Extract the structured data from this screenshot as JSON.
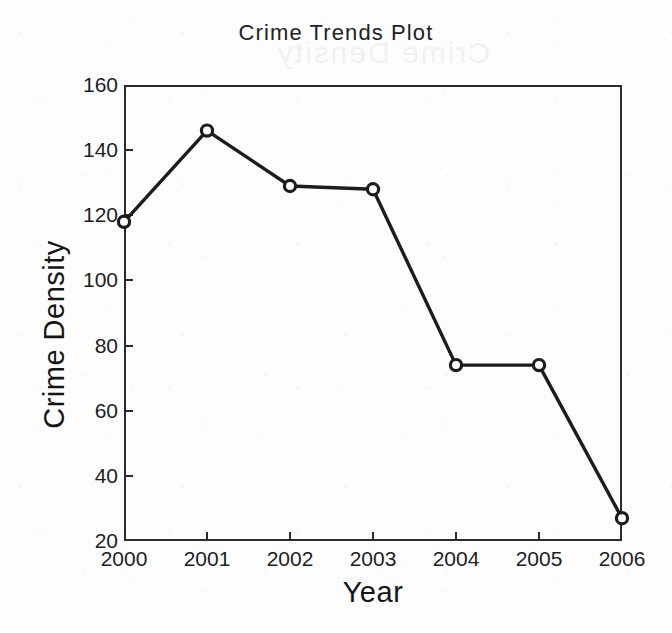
{
  "chart_data": {
    "type": "line",
    "title": "Crime Trends Plot",
    "xlabel": "Year",
    "ylabel": "Crime Density",
    "categories": [
      "2000",
      "2001",
      "2002",
      "2003",
      "2004",
      "2005",
      "2006"
    ],
    "x": [
      2000,
      2001,
      2002,
      2003,
      2004,
      2005,
      2006
    ],
    "values": [
      118,
      146,
      129,
      128,
      74,
      74,
      27
    ],
    "series": [
      {
        "name": "Crime Density",
        "values": [
          118,
          146,
          129,
          128,
          74,
          74,
          27
        ]
      }
    ],
    "xlim": [
      2000,
      2006
    ],
    "ylim": [
      20,
      160
    ],
    "ytick_labels": [
      "20",
      "40",
      "60",
      "80",
      "100",
      "120",
      "140",
      "160"
    ],
    "ytick_values": [
      20,
      40,
      60,
      80,
      100,
      120,
      140,
      160
    ],
    "xtick_labels": [
      "2000",
      "2001",
      "2002",
      "2003",
      "2004",
      "2005",
      "2006"
    ],
    "grid": false,
    "legend": null,
    "marker": "open-circle",
    "line_color": "#1c1c1c",
    "background_color": "#fdfdfd",
    "axis_color": "#2a2a2a"
  },
  "ghost_text": "Crime Density"
}
